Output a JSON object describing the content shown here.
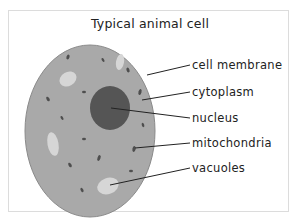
{
  "diagram": {
    "title": "Typical animal cell",
    "labels": [
      {
        "text": "cell membrane",
        "y": 59
      },
      {
        "text": "cytoplasm",
        "y": 86
      },
      {
        "text": "nucleus",
        "y": 112
      },
      {
        "text": "mitochondria",
        "y": 137
      },
      {
        "text": "vacuoles",
        "y": 162
      }
    ],
    "colors": {
      "cytoplasm": "#a9a9a9",
      "membrane": "#7a7a7a",
      "nucleus": "#555555",
      "vacuole": "#d6d6d6",
      "mitochondria": "#4e4e4e",
      "leader_line": "#222222",
      "text": "#222222"
    }
  }
}
